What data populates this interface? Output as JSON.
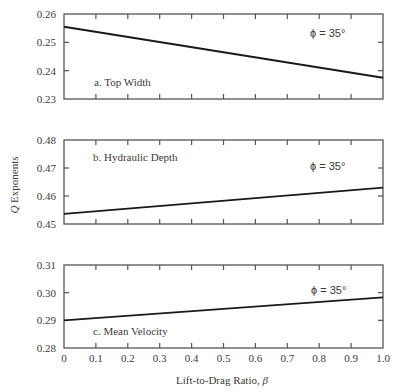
{
  "chart_data": [
    {
      "type": "line",
      "panel": "a",
      "title": "a. Top Width",
      "annotation": "ϕ = 35°",
      "x": [
        0,
        1.0
      ],
      "series": [
        {
          "name": "Top Width",
          "values": [
            0.2555,
            0.2375
          ]
        }
      ],
      "xlim": [
        0,
        1.0
      ],
      "ylim": [
        0.23,
        0.26
      ],
      "yticks": [
        "0.23",
        "0.24",
        "0.25",
        "0.26"
      ],
      "grid": false
    },
    {
      "type": "line",
      "panel": "b",
      "title": "b. Hydraulic Depth",
      "annotation": "ϕ = 35°",
      "x": [
        0,
        1.0
      ],
      "series": [
        {
          "name": "Hydraulic Depth",
          "values": [
            0.4536,
            0.463
          ]
        }
      ],
      "xlim": [
        0,
        1.0
      ],
      "ylim": [
        0.45,
        0.48
      ],
      "yticks": [
        "0.45",
        "0.46",
        "0.47",
        "0.48"
      ],
      "grid": false
    },
    {
      "type": "line",
      "panel": "c",
      "title": "c. Mean Velocity",
      "annotation": "ϕ = 35°",
      "x": [
        0,
        1.0
      ],
      "series": [
        {
          "name": "Mean Velocity",
          "values": [
            0.29,
            0.2983
          ]
        }
      ],
      "xlim": [
        0,
        1.0
      ],
      "ylim": [
        0.28,
        0.31
      ],
      "yticks": [
        "0.28",
        "0.29",
        "0.30",
        "0.31"
      ],
      "grid": false
    }
  ],
  "axes": {
    "ylabel_italic": "Q",
    "ylabel_rest": " Exponents",
    "xlabel_text": "Lift-to-Drag Ratio, ",
    "xlabel_symbol": "β",
    "xticks": [
      "0",
      "0.1",
      "0.2",
      "0.3",
      "0.4",
      "0.5",
      "0.6",
      "0.7",
      "0.8",
      "0.9",
      "1.0"
    ]
  },
  "colors": {
    "line": "#1a1a1a",
    "frame": "#555555",
    "text": "#3a3a3a"
  }
}
